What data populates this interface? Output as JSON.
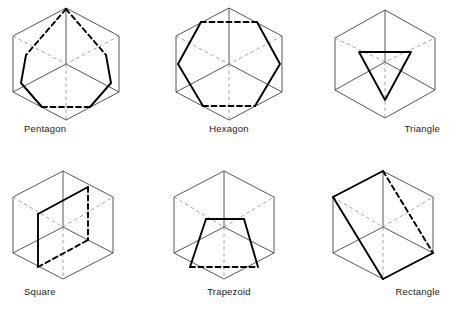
{
  "page": {
    "background_color": "#ffffff",
    "columns": 3,
    "rows": 2
  },
  "style": {
    "cube_edge_color": "#2b2b2b",
    "cube_hidden_color": "#8a8a8a",
    "section_color": "#000000",
    "caption_color": "#1a1a1a"
  },
  "figures": [
    {
      "id": "pentagon",
      "caption": "Pentagon",
      "position": "row1-col1",
      "section_shape": "pentagon",
      "section_sides": 5,
      "visible_section_edges": 3,
      "hidden_section_edges": 2
    },
    {
      "id": "hexagon",
      "caption": "Hexagon",
      "position": "row1-col2",
      "section_shape": "hexagon",
      "section_sides": 6,
      "visible_section_edges": 4,
      "hidden_section_edges": 2
    },
    {
      "id": "triangle",
      "caption": "Triangle",
      "position": "row1-col3",
      "section_shape": "triangle",
      "section_sides": 3,
      "visible_section_edges": 3,
      "hidden_section_edges": 0
    },
    {
      "id": "square",
      "caption": "Square",
      "position": "row2-col1",
      "section_shape": "square",
      "section_sides": 4,
      "visible_section_edges": 2,
      "hidden_section_edges": 2
    },
    {
      "id": "trapezoid",
      "caption": "Trapezoid",
      "position": "row2-col2",
      "section_shape": "trapezoid",
      "section_sides": 4,
      "visible_section_edges": 3,
      "hidden_section_edges": 1
    },
    {
      "id": "rectangle",
      "caption": "Rectangle",
      "position": "row2-col3",
      "section_shape": "rectangle",
      "section_sides": 4,
      "visible_section_edges": 3,
      "hidden_section_edges": 1
    }
  ]
}
